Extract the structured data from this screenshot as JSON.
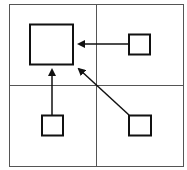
{
  "diagram": {
    "colors": {
      "background": "#ffffff",
      "grid": "#555555",
      "shapes": "#111111"
    },
    "grid": {
      "x": 9,
      "y": 4,
      "width": 174,
      "height": 162,
      "col_divider_x": 96,
      "row_divider_y": 85
    },
    "nodes": [
      {
        "id": "large-square",
        "quadrant": "top-left",
        "x": 30,
        "y": 24,
        "w": 43,
        "h": 40
      },
      {
        "id": "small-square-top-right",
        "quadrant": "top-right",
        "x": 129,
        "y": 34,
        "w": 21,
        "h": 20
      },
      {
        "id": "small-square-bottom-left",
        "quadrant": "bottom-left",
        "x": 42,
        "y": 115,
        "w": 21,
        "h": 20
      },
      {
        "id": "small-square-bottom-right",
        "quadrant": "bottom-right",
        "x": 129,
        "y": 115,
        "w": 22,
        "h": 20
      }
    ],
    "edges": [
      {
        "from": "small-square-top-right",
        "to": "large-square",
        "direction": "left"
      },
      {
        "from": "small-square-bottom-left",
        "to": "large-square",
        "direction": "up"
      },
      {
        "from": "small-square-bottom-right",
        "to": "large-square",
        "direction": "up-left"
      }
    ]
  }
}
